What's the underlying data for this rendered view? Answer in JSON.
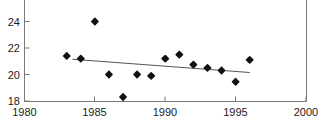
{
  "chart_data": {
    "type": "scatter",
    "title": "",
    "subtitle": "",
    "xlabel": "",
    "ylabel": "",
    "xlim": [
      1980,
      2000
    ],
    "ylim": [
      18,
      24.7
    ],
    "grid": false,
    "legend": false,
    "legend_position": "none",
    "x_ticks": [
      1980,
      1985,
      1990,
      1995,
      2000
    ],
    "x_tick_labels": [
      "1980",
      "1985",
      "1990",
      "1995",
      "2000"
    ],
    "y_ticks": [
      18,
      20,
      22,
      24
    ],
    "y_tick_labels": [
      "18",
      "20",
      "22",
      "24"
    ],
    "marker": "filled-diamond",
    "marker_color": "#111111",
    "x": [
      1983,
      1984,
      1985,
      1986,
      1987,
      1988,
      1989,
      1990,
      1991,
      1992,
      1993,
      1994,
      1995,
      1996
    ],
    "values": [
      21.4,
      21.2,
      24.0,
      20.0,
      18.3,
      20.0,
      19.9,
      21.2,
      21.5,
      20.75,
      20.5,
      20.3,
      19.45,
      21.1
    ],
    "series": [
      {
        "name": "observations",
        "type": "scatter",
        "x": [
          1983,
          1984,
          1985,
          1986,
          1987,
          1988,
          1989,
          1990,
          1991,
          1992,
          1993,
          1994,
          1995,
          1996
        ],
        "values": [
          21.4,
          21.2,
          24.0,
          20.0,
          18.3,
          20.0,
          19.9,
          21.2,
          21.5,
          20.75,
          20.5,
          20.3,
          19.45,
          21.1
        ]
      },
      {
        "name": "trend-line",
        "type": "line",
        "x": [
          1983.4,
          1996.0
        ],
        "values": [
          21.15,
          20.15
        ],
        "color": "#555555"
      }
    ],
    "axis_color": "#7a7a7a",
    "text_color": "#1a1a1a"
  },
  "axes": {
    "y_axis_name": "y-axis",
    "x_axis_name": "x-axis"
  }
}
